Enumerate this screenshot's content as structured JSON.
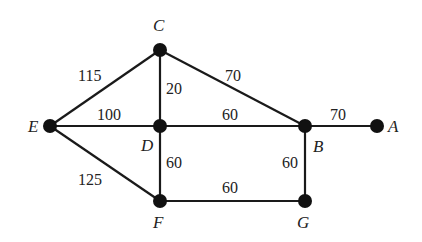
{
  "graph": {
    "nodes": [
      {
        "id": "A",
        "label": "A",
        "x": 377,
        "y": 126,
        "lx": 388,
        "ly": 132
      },
      {
        "id": "B",
        "label": "B",
        "x": 305,
        "y": 126,
        "lx": 313,
        "ly": 152
      },
      {
        "id": "C",
        "label": "C",
        "x": 160,
        "y": 50,
        "lx": 153,
        "ly": 31
      },
      {
        "id": "D",
        "label": "D",
        "x": 160,
        "y": 126,
        "lx": 141,
        "ly": 151
      },
      {
        "id": "E",
        "label": "E",
        "x": 50,
        "y": 126,
        "lx": 28,
        "ly": 132
      },
      {
        "id": "F",
        "label": "F",
        "x": 160,
        "y": 201,
        "lx": 153,
        "ly": 228
      },
      {
        "id": "G",
        "label": "G",
        "x": 305,
        "y": 201,
        "lx": 297,
        "ly": 228
      }
    ],
    "edges": [
      {
        "from": "E",
        "to": "C",
        "weight": "115",
        "lx": 78,
        "ly": 81
      },
      {
        "from": "C",
        "to": "D",
        "weight": "20",
        "lx": 166,
        "ly": 94
      },
      {
        "from": "C",
        "to": "B",
        "weight": "70",
        "lx": 225,
        "ly": 81
      },
      {
        "from": "E",
        "to": "D",
        "weight": "100",
        "lx": 97,
        "ly": 120
      },
      {
        "from": "D",
        "to": "B",
        "weight": "60",
        "lx": 222,
        "ly": 120
      },
      {
        "from": "B",
        "to": "A",
        "weight": "70",
        "lx": 330,
        "ly": 120
      },
      {
        "from": "E",
        "to": "F",
        "weight": "125",
        "lx": 78,
        "ly": 185
      },
      {
        "from": "D",
        "to": "F",
        "weight": "60",
        "lx": 166,
        "ly": 168
      },
      {
        "from": "B",
        "to": "G",
        "weight": "60",
        "lx": 282,
        "ly": 168
      },
      {
        "from": "F",
        "to": "G",
        "weight": "60",
        "lx": 222,
        "ly": 193
      }
    ]
  }
}
